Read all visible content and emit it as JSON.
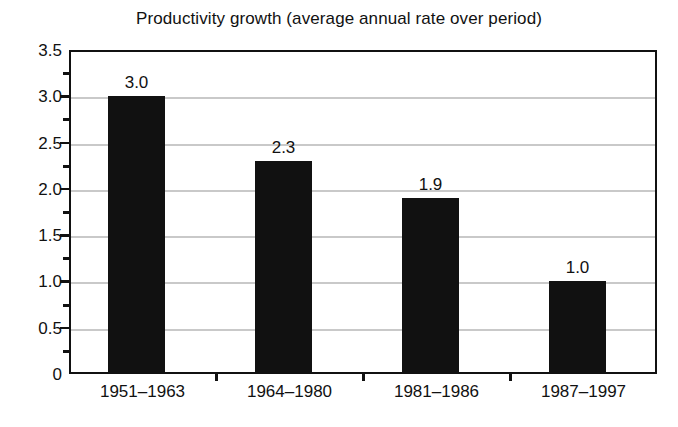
{
  "chart_data": {
    "type": "bar",
    "title": "Productivity growth (average annual rate over period)",
    "xlabel": "",
    "ylabel": "",
    "categories": [
      "1951–1963",
      "1964–1980",
      "1981–1986",
      "1987–1997"
    ],
    "values": [
      3.0,
      2.3,
      1.9,
      1.0
    ],
    "value_labels": [
      "3.0",
      "2.3",
      "1.9",
      "1.0"
    ],
    "ylim": [
      0,
      3.5
    ],
    "y_ticks": [
      0,
      0.5,
      1.0,
      1.5,
      2.0,
      2.5,
      3.0,
      3.5
    ],
    "y_tick_labels": [
      "0",
      "0.5",
      "1.0",
      "1.5",
      "2.0",
      "2.5",
      "3.0",
      "3.5"
    ],
    "y_minor_ticks": [
      0.25,
      0.75,
      1.25,
      1.75,
      2.25,
      2.75,
      3.25
    ],
    "grid": true,
    "grid_axis": "y",
    "legend": false,
    "legend_position": "none",
    "bar_color": "#111111",
    "grid_color": "#c9c9c9",
    "axis_color": "#111111",
    "background_color": "#ffffff"
  }
}
